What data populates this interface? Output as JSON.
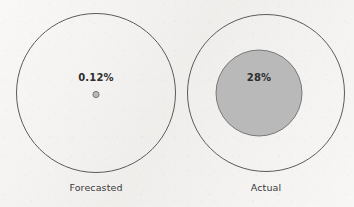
{
  "chart_data": {
    "type": "pie",
    "title": "",
    "subtitle": "",
    "xlabel": "",
    "ylabel": "",
    "legend": "none",
    "grid": false,
    "annotation": "Two proportional-area nested circle charts comparing a forecasted share against the actual share; the outer circle represents 100% in each panel and the inner filled circle represents the stated percentage.",
    "categories": [
      "Forecasted",
      "Actual"
    ],
    "values": [
      0.12,
      28
    ],
    "value_labels": [
      "0.12%",
      "28%"
    ],
    "series": [
      {
        "name": "Share of whole",
        "values": [
          0.12,
          28
        ]
      }
    ],
    "panels": [
      {
        "id": "forecasted",
        "caption": "Forecasted",
        "value_label": "0.12%",
        "value": 0.12,
        "whole": 100,
        "outer_center_x": 96,
        "outer_center_y": 93,
        "outer_radius": 80,
        "inner_center_x": 96,
        "inner_center_y": 94.5,
        "inner_radius": 3.1,
        "label_x": 96,
        "label_y": 81,
        "caption_x": 96,
        "caption_y": 191
      },
      {
        "id": "actual",
        "caption": "Actual",
        "value_label": "28%",
        "value": 28,
        "whole": 100,
        "outer_center_x": 266,
        "outer_center_y": 93,
        "outer_radius": 79,
        "inner_center_x": 259,
        "inner_center_y": 93,
        "inner_radius": 43,
        "label_x": 259,
        "label_y": 81,
        "caption_x": 266,
        "caption_y": 191
      }
    ],
    "ylim": [
      0,
      100
    ]
  },
  "colors": {
    "background": "#f1f0ee",
    "outer_stroke": "#4a4a4a",
    "inner_fill": "#b9b9b9",
    "inner_stroke": "#6d6d6d",
    "value_text": "#2e2e2e",
    "caption_text": "#3a3a3a"
  },
  "panel_left": {
    "value_label": "0.12%",
    "caption": "Forecasted"
  },
  "panel_right": {
    "value_label": "28%",
    "caption": "Actual"
  }
}
